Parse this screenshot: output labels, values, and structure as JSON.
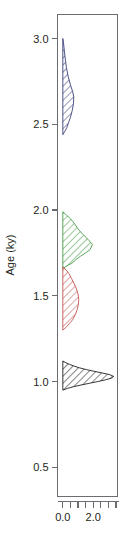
{
  "chart_data": {
    "type": "area",
    "title": "",
    "subtitle": "",
    "xlabel": "",
    "ylabel": "Age (ky)",
    "orientation": "horizontal-density-vertical-age",
    "grid": false,
    "legend": "none",
    "xlim": [
      -0.35,
      3.6
    ],
    "ylim": [
      0.33,
      3.14
    ],
    "x_ticks": [
      0.0,
      0.5,
      1.0,
      1.5,
      2.0,
      2.5,
      3.0,
      3.5
    ],
    "x_tick_labels": [
      "0.0",
      "",
      "",
      "",
      "2.0",
      "",
      "",
      ""
    ],
    "y_ticks": [
      0.5,
      1.0,
      1.5,
      2.0,
      2.5,
      3.0
    ],
    "y_tick_labels": [
      "0.5",
      "1.0",
      "1.5",
      "2.0",
      "2.5",
      "3.0"
    ],
    "series": [
      {
        "name": "density-navy",
        "color": "#3b3f7a",
        "fill_pattern": "diagonal-hatch",
        "peak_age": 2.66,
        "peak_density": 0.72,
        "age_range": [
          2.44,
          3.0
        ],
        "points": [
          {
            "age": 3.0,
            "density": 0.0
          },
          {
            "age": 2.97,
            "density": 0.05
          },
          {
            "age": 2.93,
            "density": 0.1
          },
          {
            "age": 2.88,
            "density": 0.16
          },
          {
            "age": 2.83,
            "density": 0.24
          },
          {
            "age": 2.78,
            "density": 0.35
          },
          {
            "age": 2.73,
            "density": 0.5
          },
          {
            "age": 2.69,
            "density": 0.65
          },
          {
            "age": 2.66,
            "density": 0.72
          },
          {
            "age": 2.62,
            "density": 0.7
          },
          {
            "age": 2.58,
            "density": 0.62
          },
          {
            "age": 2.54,
            "density": 0.5
          },
          {
            "age": 2.51,
            "density": 0.38
          },
          {
            "age": 2.48,
            "density": 0.26
          },
          {
            "age": 2.46,
            "density": 0.14
          },
          {
            "age": 2.44,
            "density": 0.0
          }
        ]
      },
      {
        "name": "density-green",
        "color": "#4a9e4a",
        "fill_pattern": "diagonal-hatch",
        "peak_age": 1.8,
        "peak_density": 1.95,
        "age_range": [
          1.66,
          1.99
        ],
        "points": [
          {
            "age": 1.99,
            "density": 0.0
          },
          {
            "age": 1.97,
            "density": 0.25
          },
          {
            "age": 1.95,
            "density": 0.5
          },
          {
            "age": 1.92,
            "density": 0.78
          },
          {
            "age": 1.89,
            "density": 1.0
          },
          {
            "age": 1.86,
            "density": 1.3
          },
          {
            "age": 1.83,
            "density": 1.65
          },
          {
            "age": 1.8,
            "density": 1.95
          },
          {
            "age": 1.77,
            "density": 1.8
          },
          {
            "age": 1.75,
            "density": 1.5
          },
          {
            "age": 1.73,
            "density": 1.15
          },
          {
            "age": 1.71,
            "density": 0.85
          },
          {
            "age": 1.69,
            "density": 0.6
          },
          {
            "age": 1.68,
            "density": 0.38
          },
          {
            "age": 1.67,
            "density": 0.2
          },
          {
            "age": 1.66,
            "density": 0.0
          }
        ]
      },
      {
        "name": "density-red",
        "color": "#c0564f",
        "fill_pattern": "diagonal-hatch",
        "peak_age": 1.48,
        "peak_density": 1.05,
        "age_range": [
          1.3,
          1.67
        ],
        "points": [
          {
            "age": 1.67,
            "density": 0.0
          },
          {
            "age": 1.65,
            "density": 0.22
          },
          {
            "age": 1.63,
            "density": 0.4
          },
          {
            "age": 1.6,
            "density": 0.58
          },
          {
            "age": 1.57,
            "density": 0.75
          },
          {
            "age": 1.54,
            "density": 0.9
          },
          {
            "age": 1.51,
            "density": 1.0
          },
          {
            "age": 1.48,
            "density": 1.05
          },
          {
            "age": 1.45,
            "density": 1.02
          },
          {
            "age": 1.42,
            "density": 0.95
          },
          {
            "age": 1.39,
            "density": 0.82
          },
          {
            "age": 1.36,
            "density": 0.64
          },
          {
            "age": 1.34,
            "density": 0.45
          },
          {
            "age": 1.32,
            "density": 0.25
          },
          {
            "age": 1.3,
            "density": 0.0
          }
        ]
      },
      {
        "name": "density-black",
        "color": "#231f20",
        "fill_pattern": "diagonal-hatch",
        "peak_age": 1.03,
        "peak_density": 3.35,
        "age_range": [
          0.95,
          1.12
        ],
        "points": [
          {
            "age": 1.12,
            "density": 0.0
          },
          {
            "age": 1.11,
            "density": 0.2
          },
          {
            "age": 1.1,
            "density": 0.45
          },
          {
            "age": 1.09,
            "density": 0.75
          },
          {
            "age": 1.08,
            "density": 1.1
          },
          {
            "age": 1.07,
            "density": 1.55
          },
          {
            "age": 1.06,
            "density": 2.05
          },
          {
            "age": 1.05,
            "density": 2.6
          },
          {
            "age": 1.04,
            "density": 3.1
          },
          {
            "age": 1.03,
            "density": 3.35
          },
          {
            "age": 1.02,
            "density": 3.2
          },
          {
            "age": 1.01,
            "density": 2.8
          },
          {
            "age": 1.0,
            "density": 2.3
          },
          {
            "age": 0.99,
            "density": 1.75
          },
          {
            "age": 0.98,
            "density": 1.2
          },
          {
            "age": 0.97,
            "density": 0.7
          },
          {
            "age": 0.96,
            "density": 0.3
          },
          {
            "age": 0.95,
            "density": 0.0
          }
        ]
      }
    ]
  },
  "axes": {
    "y_title": "Age (ky)",
    "y_labels": [
      "3.0",
      "2.5",
      "2.0",
      "1.5",
      "1.0",
      "0.5"
    ],
    "x_labels": [
      "0.0",
      "2.0"
    ]
  }
}
